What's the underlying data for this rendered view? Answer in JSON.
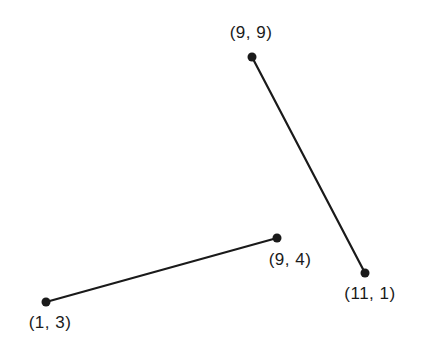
{
  "diagram": {
    "type": "line-segments",
    "ink_color": "#1a1a1a",
    "background": "#ffffff",
    "segments": [
      {
        "name": "segment-a",
        "from": {
          "label": "(9, 9)",
          "coords": [
            9,
            9
          ]
        },
        "to": {
          "label": "(11, 1)",
          "coords": [
            11,
            1
          ]
        }
      },
      {
        "name": "segment-b",
        "from": {
          "label": "(1, 3)",
          "coords": [
            1,
            3
          ]
        },
        "to": {
          "label": "(9, 4)",
          "coords": [
            9,
            4
          ]
        }
      }
    ],
    "points": [
      {
        "label": "(9, 9)",
        "x": 9,
        "y": 9
      },
      {
        "label": "(11, 1)",
        "x": 11,
        "y": 1
      },
      {
        "label": "(1, 3)",
        "x": 1,
        "y": 3
      },
      {
        "label": "(9, 4)",
        "x": 9,
        "y": 4
      }
    ]
  }
}
